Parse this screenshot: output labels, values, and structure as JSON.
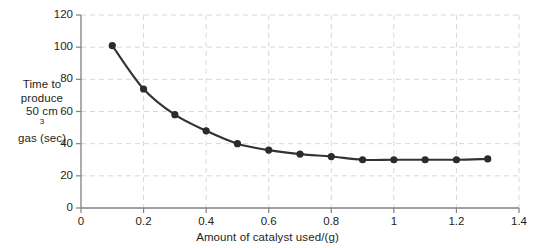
{
  "chart_data": {
    "type": "line",
    "title": "",
    "subtitle": "",
    "xlabel": "Amount of catalyst used/(g)",
    "ylabel_lines": [
      "Time to",
      "produce",
      "50 cm3",
      "gas (sec)"
    ],
    "ylabel_plain": "Time to produce 50 cm3 gas (sec)",
    "ylabel_superscript_line": {
      "prefix": "50 cm",
      "sup": "3",
      "suffix": ""
    },
    "x": [
      0.1,
      0.2,
      0.3,
      0.4,
      0.5,
      0.6,
      0.7,
      0.8,
      0.9,
      1.0,
      1.1,
      1.2,
      1.3
    ],
    "values": [
      101,
      74,
      58,
      48,
      40,
      36,
      33.5,
      32,
      30,
      30,
      30,
      30,
      30.5
    ],
    "series": [
      {
        "name": "Time to produce 50 cm3 gas",
        "values": [
          101,
          74,
          58,
          48,
          40,
          36,
          33.5,
          32,
          30,
          30,
          30,
          30,
          30.5
        ]
      }
    ],
    "xlim": [
      0,
      1.4
    ],
    "ylim": [
      0,
      120
    ],
    "xticks": [
      0,
      0.2,
      0.4,
      0.6,
      0.8,
      1,
      1.2,
      1.4
    ],
    "xtick_labels": [
      "0",
      "0.2",
      "0.4",
      "0.6",
      "0.8",
      "1",
      "1.2",
      "1.4"
    ],
    "yticks": [
      0,
      20,
      40,
      60,
      80,
      100,
      120
    ],
    "ytick_labels": [
      "0",
      "20",
      "40",
      "60",
      "80",
      "100",
      "120"
    ],
    "grid": true,
    "grid_style": "dashed",
    "legend": false,
    "legend_position": "none",
    "marker": "circle",
    "colors": {
      "line": "#333333",
      "marker": "#2b2b2b",
      "grid": "#d8d8da",
      "axis": "#808084",
      "text": "#231f20",
      "background": "#ffffff"
    }
  }
}
